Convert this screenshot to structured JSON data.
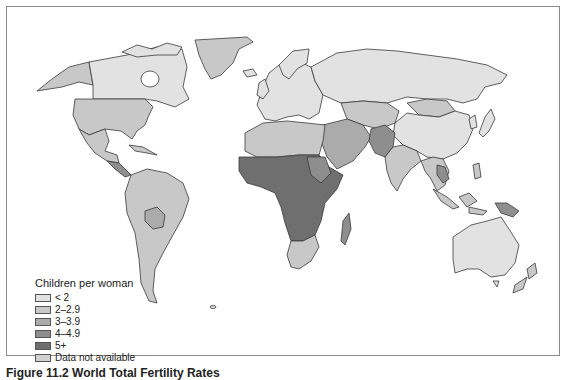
{
  "figure": {
    "caption": "Figure 11.2 World Total Fertility Rates"
  },
  "legend": {
    "title": "Children per woman",
    "items": [
      {
        "label": "< 2",
        "color": "#e2e2e2"
      },
      {
        "label": "2–2.9",
        "color": "#c8c8c8"
      },
      {
        "label": "3–3.9",
        "color": "#ababab"
      },
      {
        "label": "4–4.9",
        "color": "#8e8e8e"
      },
      {
        "label": "5+",
        "color": "#6f6f6f"
      },
      {
        "label": "Data not available",
        "color": "#d0d0d0"
      }
    ]
  },
  "map": {
    "type": "choropleth",
    "regions": [
      {
        "name": "Canada",
        "class": "< 2"
      },
      {
        "name": "Alaska (USA)",
        "class": "2–2.9"
      },
      {
        "name": "United States",
        "class": "2–2.9"
      },
      {
        "name": "Greenland",
        "class": "2–2.9"
      },
      {
        "name": "Mexico",
        "class": "2–2.9"
      },
      {
        "name": "Central America",
        "class": "3–3.9"
      },
      {
        "name": "South America",
        "class": "2–2.9"
      },
      {
        "name": "Bolivia",
        "class": "3–3.9"
      },
      {
        "name": "Europe",
        "class": "< 2"
      },
      {
        "name": "Russia",
        "class": "< 2"
      },
      {
        "name": "North Africa",
        "class": "2–2.9"
      },
      {
        "name": "Sub-Saharan Africa",
        "class": "5+"
      },
      {
        "name": "Southern Africa",
        "class": "2–2.9"
      },
      {
        "name": "Madagascar",
        "class": "4–4.9"
      },
      {
        "name": "Middle East",
        "class": "3–3.9"
      },
      {
        "name": "Afghanistan / Pakistan",
        "class": "4–4.9"
      },
      {
        "name": "India",
        "class": "2–2.9"
      },
      {
        "name": "Central Asia",
        "class": "2–2.9"
      },
      {
        "name": "Mongolia",
        "class": "2–2.9"
      },
      {
        "name": "China",
        "class": "< 2"
      },
      {
        "name": "Japan",
        "class": "< 2"
      },
      {
        "name": "Southeast Asia",
        "class": "2–2.9"
      },
      {
        "name": "Laos",
        "class": "4–4.9"
      },
      {
        "name": "Indonesia",
        "class": "2–2.9"
      },
      {
        "name": "Papua New Guinea",
        "class": "4–4.9"
      },
      {
        "name": "Australia",
        "class": "< 2"
      },
      {
        "name": "New Zealand",
        "class": "2–2.9"
      }
    ]
  }
}
